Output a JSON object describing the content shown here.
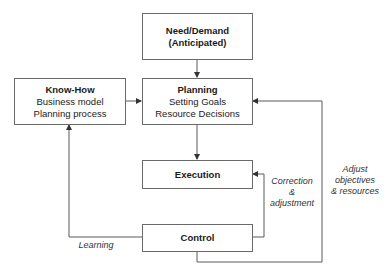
{
  "diagram": {
    "nodes": {
      "need": {
        "title": "Need/Demand",
        "subtitle": "(Anticipated)"
      },
      "knowhow": {
        "title": "Know-How",
        "lines": [
          "Business model",
          "Planning process"
        ]
      },
      "planning": {
        "title": "Planning",
        "lines": [
          "Setting Goals",
          "Resource Decisions"
        ]
      },
      "execution": {
        "title": "Execution"
      },
      "control": {
        "title": "Control"
      }
    },
    "edges": [
      {
        "from": "need",
        "to": "planning",
        "label": ""
      },
      {
        "from": "knowhow",
        "to": "planning",
        "label": ""
      },
      {
        "from": "planning",
        "to": "execution",
        "label": ""
      },
      {
        "from": "execution",
        "to": "control",
        "label": ""
      },
      {
        "from": "control",
        "to": "execution",
        "label": "Correction & adjustment"
      },
      {
        "from": "control",
        "to": "planning",
        "label": "Adjust objectives & resources"
      },
      {
        "from": "control",
        "to": "knowhow",
        "label": "Learning"
      }
    ],
    "labels": {
      "correction": [
        "Correction",
        "&",
        "adjustment"
      ],
      "adjust": [
        "Adjust",
        "objectives",
        "& resources"
      ],
      "learning": "Learning"
    },
    "colors": {
      "line": "#5a5a5a",
      "border": "#6a6a6a",
      "text": "#1a1a1a"
    }
  }
}
